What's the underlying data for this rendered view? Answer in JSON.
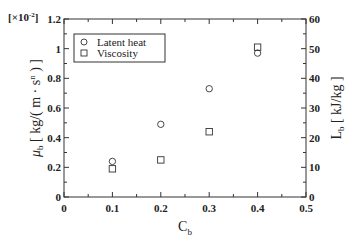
{
  "chart_data": {
    "type": "scatter",
    "title": "",
    "xlabel": "C_b",
    "ylabel": "μ_b [ kg/( m · s^n ) ]",
    "ylabel_right": "L_b [ kJ/kg ]",
    "y_multiplier": "[×10^-2]",
    "xlim": [
      0,
      0.5
    ],
    "ylim": [
      0,
      1.2
    ],
    "ylim_right": [
      0,
      60
    ],
    "x_ticks": [
      "0",
      "0.1",
      "0.2",
      "0.3",
      "0.4",
      "0.5"
    ],
    "y_ticks": [
      "0",
      "0.2",
      "0.4",
      "0.6",
      "0.8",
      "1",
      "1.2"
    ],
    "y_ticks_right": [
      "0",
      "10",
      "20",
      "30",
      "40",
      "50",
      "60"
    ],
    "legend_position": "upper left",
    "grid": false,
    "series": [
      {
        "name": "Latent heat",
        "marker": "circle",
        "axis": "right",
        "x": [
          0.1,
          0.2,
          0.3,
          0.4
        ],
        "values": [
          12,
          24.5,
          36.5,
          48.5
        ]
      },
      {
        "name": "Viscosity",
        "marker": "square",
        "axis": "left",
        "x": [
          0.1,
          0.2,
          0.3,
          0.4
        ],
        "values": [
          0.19,
          0.25,
          0.44,
          1.01
        ]
      }
    ]
  },
  "labels": {
    "multiplier_prefix": "[×10",
    "multiplier_exp": "-2",
    "multiplier_suffix": "]",
    "y_left_mu": "μ",
    "y_left_sub": "b",
    "y_left_unit": " [ kg/( m · s",
    "y_left_exp": "n",
    "y_left_close": " ) ]",
    "y_right_L": "L",
    "y_right_sub": "b",
    "y_right_unit": " [ kJ/kg ]",
    "x_C": "C",
    "x_sub": "b",
    "legend_latent": "Latent heat",
    "legend_viscosity": "Viscosity"
  }
}
